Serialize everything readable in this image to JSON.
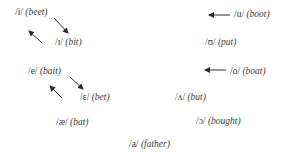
{
  "vowels": [
    {
      "id": "i",
      "symbol": "/i/",
      "example": "(beet)",
      "x": 15,
      "y": 7
    },
    {
      "id": "ih",
      "symbol": "/ɪ/",
      "example": "(bit)",
      "x": 55,
      "y": 37
    },
    {
      "id": "e",
      "symbol": "/e/",
      "example": "(bait)",
      "x": 28,
      "y": 66
    },
    {
      "id": "eh",
      "symbol": "/ɛ/",
      "example": "(bet)",
      "x": 80,
      "y": 92
    },
    {
      "id": "ae",
      "symbol": "/æ/",
      "example": "(bat)",
      "x": 56,
      "y": 117
    },
    {
      "id": "u",
      "symbol": "/u/",
      "example": "(boot)",
      "x": 234,
      "y": 9
    },
    {
      "id": "uh",
      "symbol": "/ʊ/",
      "example": "(put)",
      "x": 205,
      "y": 37
    },
    {
      "id": "o",
      "symbol": "/o/",
      "example": "(boat)",
      "x": 230,
      "y": 66
    },
    {
      "id": "wedge",
      "symbol": "/ʌ/",
      "example": "(but)",
      "x": 175,
      "y": 92
    },
    {
      "id": "open-o",
      "symbol": "/ɔ/",
      "example": "(bought)",
      "x": 196,
      "y": 116
    },
    {
      "id": "a",
      "symbol": "/a/",
      "example": "(father)",
      "x": 129,
      "y": 139
    }
  ],
  "arrows": [
    {
      "from": "i",
      "to": "ih",
      "x1": 54,
      "y1": 18,
      "x2": 68,
      "y2": 33
    },
    {
      "from": "ih",
      "to": "i",
      "x1": 42,
      "y1": 43,
      "x2": 29,
      "y2": 31
    },
    {
      "from": "e",
      "to": "eh",
      "x1": 70,
      "y1": 77,
      "x2": 83,
      "y2": 89
    },
    {
      "from": "eh",
      "to": "e",
      "x1": 62,
      "y1": 98,
      "x2": 50,
      "y2": 86
    },
    {
      "to": "u",
      "x1": 230,
      "y1": 15,
      "x2": 209,
      "y2": 15
    },
    {
      "to": "o",
      "x1": 226,
      "y1": 70,
      "x2": 205,
      "y2": 70
    }
  ],
  "colors": {
    "text": "#3a3a3a",
    "arrow": "#2a2a2a",
    "background": "#ffffff"
  }
}
